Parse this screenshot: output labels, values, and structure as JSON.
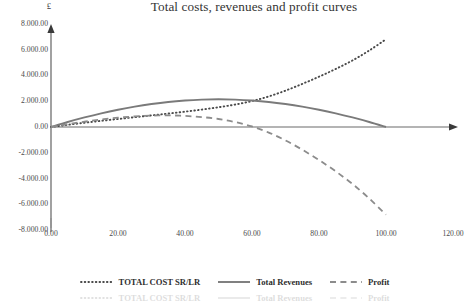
{
  "chart_data": {
    "type": "line",
    "title": "Total costs, revenues and profit curves",
    "xlabel": "Quantity",
    "ylabel": "£",
    "xlim": [
      0,
      120
    ],
    "ylim": [
      -8000,
      8000
    ],
    "grid": false,
    "legend_position": "bottom",
    "xticks": [
      "0.00",
      "20.00",
      "40.00",
      "60.00",
      "80.00",
      "100.00",
      "120.00"
    ],
    "xtick_values": [
      0,
      20,
      40,
      60,
      80,
      100,
      120
    ],
    "yticks": [
      "8.000.00",
      "6.000.00",
      "4.000.00",
      "2.000.00",
      "0.00",
      "-2.000.00",
      "-4.000.00",
      "-6.000.00",
      "-8.000.00"
    ],
    "ytick_values": [
      8000,
      6000,
      4000,
      2000,
      0,
      -2000,
      -4000,
      -6000,
      -8000
    ],
    "x": [
      0,
      5,
      10,
      15,
      20,
      25,
      30,
      35,
      40,
      45,
      50,
      55,
      60,
      65,
      70,
      75,
      80,
      85,
      90,
      95,
      100
    ],
    "series": [
      {
        "name": "TOTAL COST SR/LR",
        "style": "dotted",
        "color": "#4a4a4a",
        "values": [
          0,
          170,
          330,
          480,
          620,
          760,
          900,
          1040,
          1190,
          1350,
          1530,
          1740,
          2010,
          2370,
          2820,
          3340,
          3900,
          4500,
          5160,
          5930,
          6800
        ]
      },
      {
        "name": "Total Revenues",
        "style": "solid",
        "color": "#7a7a7a",
        "values": [
          0,
          390,
          740,
          1060,
          1340,
          1580,
          1780,
          1940,
          2050,
          2120,
          2150,
          2120,
          2050,
          1940,
          1780,
          1580,
          1340,
          1060,
          740,
          390,
          0
        ]
      },
      {
        "name": "Profit",
        "style": "dashed",
        "color": "#8c8c8c",
        "values": [
          0,
          220,
          410,
          580,
          720,
          820,
          880,
          900,
          860,
          770,
          620,
          380,
          40,
          -430,
          -1040,
          -1760,
          -2560,
          -3440,
          -4420,
          -5540,
          -6800
        ]
      }
    ]
  },
  "axes": {
    "y_axis_arrow": "up-arrow",
    "x_axis_arrow": "right-arrow"
  },
  "legend": {
    "items": [
      {
        "label": "TOTAL COST SR/LR",
        "style": "dotted"
      },
      {
        "label": "Total Revenues",
        "style": "solid"
      },
      {
        "label": "Profit",
        "style": "dashed"
      }
    ]
  }
}
